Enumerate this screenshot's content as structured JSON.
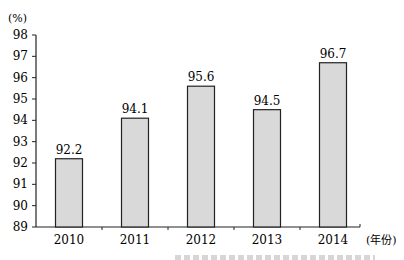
{
  "chart_data": {
    "type": "bar",
    "title": "",
    "ylabel": "(%)",
    "xlabel": "(年份)",
    "categories": [
      "2010",
      "2011",
      "2012",
      "2013",
      "2014"
    ],
    "values": [
      92.2,
      94.1,
      95.6,
      94.5,
      96.7
    ],
    "data_labels": [
      "92.2",
      "94.1",
      "95.6",
      "94.5",
      "96.7"
    ],
    "ylim": [
      89,
      98
    ],
    "yticks": [
      89,
      90,
      91,
      92,
      93,
      94,
      95,
      96,
      97,
      98
    ],
    "grid": false,
    "legend": null,
    "bar_color": "#d9d9d9",
    "bar_edge_color": "#222222"
  }
}
